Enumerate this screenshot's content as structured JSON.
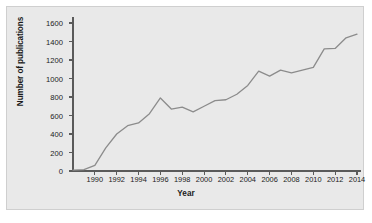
{
  "chart_data": {
    "type": "line",
    "title": "",
    "xlabel": "Year",
    "ylabel": "Number of publications",
    "xlim": [
      1988,
      2014
    ],
    "ylim": [
      0,
      1600
    ],
    "grid": false,
    "legend": null,
    "y_ticks": [
      0,
      200,
      400,
      600,
      800,
      1000,
      1200,
      1400,
      1600
    ],
    "y_tick_labels": [
      "0",
      "200",
      "400",
      "600",
      "800",
      "1000",
      "1200",
      "1400",
      "1600"
    ],
    "x_ticks": [
      1990,
      1992,
      1994,
      1996,
      1998,
      2000,
      2002,
      2004,
      2006,
      2008,
      2010,
      2012,
      2014
    ],
    "x_tick_labels": [
      "1990",
      "1992",
      "1994",
      "1996",
      "1998",
      "2000",
      "2002",
      "2004",
      "2006",
      "2008",
      "2010",
      "2012",
      "2014"
    ],
    "line_color": "#8c8c8c",
    "series": [
      {
        "name": "Number of publications",
        "x": [
          1988,
          1989,
          1990,
          1991,
          1992,
          1993,
          1994,
          1995,
          1996,
          1997,
          1998,
          1999,
          2000,
          2001,
          2002,
          2003,
          2004,
          2005,
          2006,
          2007,
          2008,
          2009,
          2010,
          2011,
          2012,
          2013,
          2014
        ],
        "values": [
          10,
          15,
          60,
          250,
          400,
          490,
          520,
          620,
          790,
          670,
          690,
          640,
          700,
          760,
          770,
          830,
          925,
          1080,
          1025,
          1090,
          1060,
          1090,
          1120,
          1320,
          1325,
          1440,
          1480
        ]
      }
    ]
  },
  "figure": {
    "background_color": "#e9e9e9",
    "border_color": "#cfcfcf",
    "page_background": "#ffffff"
  }
}
